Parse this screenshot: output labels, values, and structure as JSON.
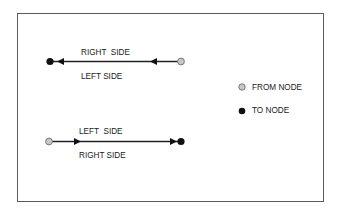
{
  "diagram": {
    "links": [
      {
        "id": "link-top",
        "direction": "right-to-left",
        "from": "from-node",
        "to": "to-node",
        "label_above": "RIGHT  SIDE",
        "label_below": "LEFT SIDE"
      },
      {
        "id": "link-bottom",
        "direction": "left-to-right",
        "from": "from-node",
        "to": "to-node",
        "label_above": "LEFT  SIDE",
        "label_below": "RIGHT SIDE"
      }
    ],
    "legend": [
      {
        "key": "from-node",
        "label": "FROM NODE",
        "color": "#c8c8c8"
      },
      {
        "key": "to-node",
        "label": "TO NODE",
        "color": "#111111"
      }
    ],
    "colors": {
      "line": "#222222",
      "frame": "#5a5a5a",
      "from_node_fill": "#c8c8c8",
      "from_node_stroke": "#777777",
      "to_node_fill": "#111111"
    }
  }
}
